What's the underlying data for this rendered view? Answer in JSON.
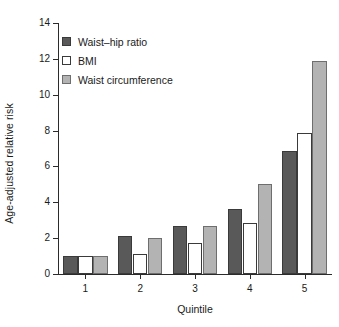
{
  "chart_data": {
    "type": "bar",
    "title": "",
    "xlabel": "Quintile",
    "ylabel": "Age-adjusted relative risk",
    "categories": [
      "1",
      "2",
      "3",
      "4",
      "5"
    ],
    "series": [
      {
        "name": "Waist–hip ratio",
        "color": "#595959",
        "values": [
          1.0,
          2.1,
          2.7,
          3.6,
          6.85
        ]
      },
      {
        "name": "BMI",
        "color": "#ffffff",
        "values": [
          1.0,
          1.1,
          1.75,
          2.85,
          7.85
        ]
      },
      {
        "name": "Waist circumference",
        "color": "#b3b3b3",
        "values": [
          1.0,
          2.0,
          2.7,
          5.0,
          11.9
        ]
      }
    ],
    "ylim": [
      0,
      14
    ],
    "yticks": [
      0,
      2,
      4,
      6,
      8,
      10,
      12,
      14
    ],
    "ytick_labels": [
      "0",
      "2",
      "4",
      "6",
      "8",
      "10",
      "12",
      "14"
    ],
    "grid": false,
    "legend_position": "upper-left-inside"
  },
  "axes": {
    "y_label": "Age-adjusted relative risk",
    "x_label": "Quintile"
  },
  "legend": {
    "entries": [
      {
        "label": "Waist–hip ratio"
      },
      {
        "label": "BMI"
      },
      {
        "label": "Waist circumference"
      }
    ]
  }
}
